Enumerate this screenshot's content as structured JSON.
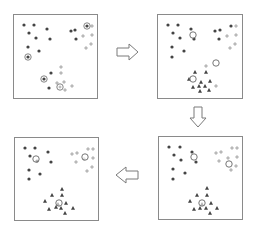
{
  "diagram": {
    "colors": {
      "border": "#8a8a8a",
      "dark_point": "#444444",
      "light_point": "#9a9a9a",
      "centroid": "#666666",
      "arrow": "#7a7a7a"
    },
    "panels": [
      {
        "id": "step-1",
        "x": 13,
        "y": 14,
        "w": 85,
        "h": 85,
        "points": [
          {
            "x": 10,
            "y": 10,
            "t": "dot"
          },
          {
            "x": 20,
            "y": 10,
            "t": "dot"
          },
          {
            "x": 33,
            "y": 14,
            "t": "dot"
          },
          {
            "x": 15,
            "y": 18,
            "t": "dot"
          },
          {
            "x": 22,
            "y": 23,
            "t": "dot"
          },
          {
            "x": 36,
            "y": 24,
            "t": "dot"
          },
          {
            "x": 14,
            "y": 32,
            "t": "dot"
          },
          {
            "x": 25,
            "y": 36,
            "t": "dot"
          },
          {
            "x": 57,
            "y": 16,
            "t": "dot"
          },
          {
            "x": 61,
            "y": 15,
            "t": "dot"
          },
          {
            "x": 62,
            "y": 24,
            "t": "dot"
          },
          {
            "x": 37,
            "y": 58,
            "t": "dot"
          },
          {
            "x": 35,
            "y": 73,
            "t": "dot"
          },
          {
            "x": 14,
            "y": 42,
            "t": "ring-dot"
          },
          {
            "x": 30,
            "y": 64,
            "t": "ring-dot"
          },
          {
            "x": 46,
            "y": 72,
            "t": "ring-plus"
          },
          {
            "x": 73,
            "y": 11,
            "t": "ring-dot"
          },
          {
            "x": 78,
            "y": 11,
            "t": "plus"
          },
          {
            "x": 69,
            "y": 21,
            "t": "plus"
          },
          {
            "x": 78,
            "y": 20,
            "t": "plus"
          },
          {
            "x": 77,
            "y": 29,
            "t": "plus"
          },
          {
            "x": 72,
            "y": 33,
            "t": "plus"
          },
          {
            "x": 47,
            "y": 52,
            "t": "plus"
          },
          {
            "x": 47,
            "y": 58,
            "t": "plus"
          },
          {
            "x": 50,
            "y": 67,
            "t": "plus"
          },
          {
            "x": 43,
            "y": 68,
            "t": "plus"
          },
          {
            "x": 58,
            "y": 71,
            "t": "plus"
          },
          {
            "x": 51,
            "y": 75,
            "t": "plus"
          }
        ]
      },
      {
        "id": "step-2",
        "x": 157,
        "y": 14,
        "w": 86,
        "h": 85,
        "points": [
          {
            "x": 10,
            "y": 10,
            "t": "dot"
          },
          {
            "x": 20,
            "y": 10,
            "t": "dot"
          },
          {
            "x": 33,
            "y": 14,
            "t": "dot"
          },
          {
            "x": 15,
            "y": 18,
            "t": "dot"
          },
          {
            "x": 22,
            "y": 23,
            "t": "dot"
          },
          {
            "x": 36,
            "y": 24,
            "t": "dot"
          },
          {
            "x": 14,
            "y": 32,
            "t": "dot"
          },
          {
            "x": 26,
            "y": 36,
            "t": "dot"
          },
          {
            "x": 14,
            "y": 42,
            "t": "dot"
          },
          {
            "x": 57,
            "y": 16,
            "t": "dot"
          },
          {
            "x": 62,
            "y": 15,
            "t": "dot"
          },
          {
            "x": 61,
            "y": 24,
            "t": "dot"
          },
          {
            "x": 73,
            "y": 11,
            "t": "dot"
          },
          {
            "x": 78,
            "y": 11,
            "t": "plus"
          },
          {
            "x": 69,
            "y": 21,
            "t": "plus"
          },
          {
            "x": 78,
            "y": 20,
            "t": "plus"
          },
          {
            "x": 77,
            "y": 29,
            "t": "plus"
          },
          {
            "x": 72,
            "y": 33,
            "t": "plus"
          },
          {
            "x": 48,
            "y": 51,
            "t": "plus"
          },
          {
            "x": 58,
            "y": 71,
            "t": "plus"
          },
          {
            "x": 37,
            "y": 57,
            "t": "tri"
          },
          {
            "x": 48,
            "y": 57,
            "t": "tri"
          },
          {
            "x": 31,
            "y": 64,
            "t": "tri"
          },
          {
            "x": 43,
            "y": 67,
            "t": "tri"
          },
          {
            "x": 52,
            "y": 66,
            "t": "tri"
          },
          {
            "x": 35,
            "y": 72,
            "t": "tri"
          },
          {
            "x": 47,
            "y": 71,
            "t": "tri"
          },
          {
            "x": 51,
            "y": 75,
            "t": "tri"
          },
          {
            "x": 41,
            "y": 71,
            "t": "tri"
          },
          {
            "x": 42,
            "y": 76,
            "t": "tri"
          },
          {
            "x": 35,
            "y": 20,
            "t": "centroid"
          },
          {
            "x": 35,
            "y": 64,
            "t": "centroid"
          },
          {
            "x": 58,
            "y": 48,
            "t": "centroid"
          }
        ]
      },
      {
        "id": "step-3",
        "x": 158,
        "y": 136,
        "w": 85,
        "h": 84,
        "points": [
          {
            "x": 10,
            "y": 10,
            "t": "dot"
          },
          {
            "x": 21,
            "y": 10,
            "t": "dot"
          },
          {
            "x": 33,
            "y": 15,
            "t": "dot"
          },
          {
            "x": 15,
            "y": 18,
            "t": "dot"
          },
          {
            "x": 22,
            "y": 23,
            "t": "dot"
          },
          {
            "x": 37,
            "y": 25,
            "t": "dot"
          },
          {
            "x": 14,
            "y": 32,
            "t": "dot"
          },
          {
            "x": 26,
            "y": 36,
            "t": "dot"
          },
          {
            "x": 14,
            "y": 42,
            "t": "dot"
          },
          {
            "x": 57,
            "y": 16,
            "t": "plus"
          },
          {
            "x": 62,
            "y": 15,
            "t": "plus"
          },
          {
            "x": 60,
            "y": 24,
            "t": "plus"
          },
          {
            "x": 73,
            "y": 11,
            "t": "plus"
          },
          {
            "x": 78,
            "y": 11,
            "t": "plus"
          },
          {
            "x": 69,
            "y": 21,
            "t": "plus"
          },
          {
            "x": 78,
            "y": 20,
            "t": "plus"
          },
          {
            "x": 77,
            "y": 29,
            "t": "plus"
          },
          {
            "x": 72,
            "y": 33,
            "t": "plus"
          },
          {
            "x": 48,
            "y": 51,
            "t": "tri"
          },
          {
            "x": 38,
            "y": 58,
            "t": "tri"
          },
          {
            "x": 48,
            "y": 58,
            "t": "tri"
          },
          {
            "x": 31,
            "y": 64,
            "t": "tri"
          },
          {
            "x": 43,
            "y": 67,
            "t": "tri"
          },
          {
            "x": 52,
            "y": 66,
            "t": "tri"
          },
          {
            "x": 35,
            "y": 72,
            "t": "tri"
          },
          {
            "x": 47,
            "y": 71,
            "t": "tri"
          },
          {
            "x": 51,
            "y": 76,
            "t": "tri"
          },
          {
            "x": 58,
            "y": 71,
            "t": "tri"
          },
          {
            "x": 41,
            "y": 71,
            "t": "tri"
          },
          {
            "x": 35,
            "y": 20,
            "t": "centroid"
          },
          {
            "x": 70,
            "y": 27,
            "t": "centroid"
          },
          {
            "x": 43,
            "y": 66,
            "t": "centroid"
          }
        ]
      },
      {
        "id": "step-4",
        "x": 14,
        "y": 137,
        "w": 85,
        "h": 84,
        "points": [
          {
            "x": 10,
            "y": 10,
            "t": "dot"
          },
          {
            "x": 20,
            "y": 10,
            "t": "dot"
          },
          {
            "x": 33,
            "y": 14,
            "t": "dot"
          },
          {
            "x": 15,
            "y": 18,
            "t": "dot"
          },
          {
            "x": 22,
            "y": 23,
            "t": "dot"
          },
          {
            "x": 36,
            "y": 24,
            "t": "dot"
          },
          {
            "x": 14,
            "y": 32,
            "t": "dot"
          },
          {
            "x": 25,
            "y": 36,
            "t": "dot"
          },
          {
            "x": 14,
            "y": 41,
            "t": "dot"
          },
          {
            "x": 57,
            "y": 16,
            "t": "plus"
          },
          {
            "x": 62,
            "y": 15,
            "t": "plus"
          },
          {
            "x": 61,
            "y": 24,
            "t": "plus"
          },
          {
            "x": 73,
            "y": 11,
            "t": "plus"
          },
          {
            "x": 78,
            "y": 11,
            "t": "plus"
          },
          {
            "x": 69,
            "y": 21,
            "t": "plus"
          },
          {
            "x": 78,
            "y": 20,
            "t": "plus"
          },
          {
            "x": 77,
            "y": 29,
            "t": "plus"
          },
          {
            "x": 72,
            "y": 33,
            "t": "plus"
          },
          {
            "x": 47,
            "y": 51,
            "t": "tri"
          },
          {
            "x": 37,
            "y": 57,
            "t": "tri"
          },
          {
            "x": 47,
            "y": 57,
            "t": "tri"
          },
          {
            "x": 30,
            "y": 63,
            "t": "tri"
          },
          {
            "x": 43,
            "y": 66,
            "t": "tri"
          },
          {
            "x": 51,
            "y": 65,
            "t": "tri"
          },
          {
            "x": 34,
            "y": 71,
            "t": "tri"
          },
          {
            "x": 46,
            "y": 70,
            "t": "tri"
          },
          {
            "x": 50,
            "y": 75,
            "t": "tri"
          },
          {
            "x": 58,
            "y": 70,
            "t": "tri"
          },
          {
            "x": 41,
            "y": 69,
            "t": "tri"
          },
          {
            "x": 21,
            "y": 21,
            "t": "centroid"
          },
          {
            "x": 70,
            "y": 19,
            "t": "centroid"
          },
          {
            "x": 44,
            "y": 65,
            "t": "centroid"
          }
        ]
      }
    ],
    "arrows": [
      {
        "id": "arrow-right",
        "dir": "right",
        "x": 116,
        "y": 43,
        "w": 23,
        "h": 18
      },
      {
        "id": "arrow-down",
        "dir": "down",
        "x": 189,
        "y": 106,
        "w": 18,
        "h": 22
      },
      {
        "id": "arrow-left",
        "dir": "left",
        "x": 115,
        "y": 166,
        "w": 24,
        "h": 18
      }
    ]
  }
}
